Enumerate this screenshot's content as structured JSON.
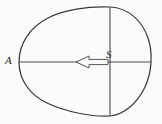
{
  "figure": {
    "background_color": "#fbfbfa",
    "stroke_color": "#3a3a3a",
    "label_color": "#2b2b2b",
    "labels": {
      "left_vertex": "A",
      "chord_top": "S"
    },
    "elements": {
      "outline_name": "closed-blob-outline",
      "horizontal_axis_name": "horizontal-axis-line",
      "vertical_chord_name": "vertical-chord-line",
      "arrow_name": "hollow-left-arrow"
    },
    "geometry": {
      "blob_left_vertex": [
        19,
        62
      ],
      "blob_top_point": [
        110,
        7
      ],
      "blob_bottom_point": [
        110,
        116
      ],
      "blob_right_extreme": [
        151,
        62
      ],
      "horizontal_line": {
        "x1": 19,
        "y1": 62,
        "x2": 151,
        "y2": 62
      },
      "vertical_line": {
        "x1": 110,
        "y1": 7,
        "x2": 110,
        "y2": 116
      },
      "arrow": {
        "tip_x": 76,
        "head_base_x": 89,
        "tail_x": 108,
        "center_y": 62,
        "head_half_height": 6,
        "shaft_half_height": 2.6,
        "direction": "left",
        "fill": "none"
      }
    }
  }
}
